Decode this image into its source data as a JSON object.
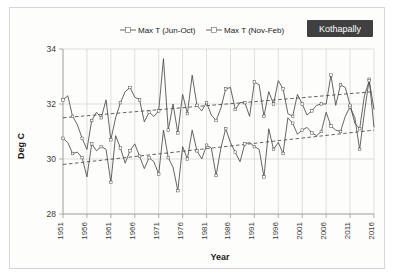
{
  "badge": {
    "label": "Kothapally",
    "bg": "#404040",
    "fg": "#ffffff"
  },
  "chart_data": {
    "type": "line",
    "title": "",
    "xlabel": "Year",
    "ylabel": "Deg C",
    "xlim": [
      1951,
      2016
    ],
    "ylim": [
      28,
      34
    ],
    "yticks": [
      28,
      30,
      32,
      34
    ],
    "xticks": [
      1951,
      1956,
      1961,
      1966,
      1971,
      1976,
      1981,
      1986,
      1991,
      1996,
      2001,
      2006,
      2011,
      2016
    ],
    "grid": true,
    "legend_position": "top-center",
    "line_color": "#4a4a4a",
    "trend_color": "#3a3a3a",
    "x": [
      1951,
      1952,
      1953,
      1954,
      1955,
      1956,
      1957,
      1958,
      1959,
      1960,
      1961,
      1962,
      1963,
      1964,
      1965,
      1966,
      1967,
      1968,
      1969,
      1970,
      1971,
      1972,
      1973,
      1974,
      1975,
      1976,
      1977,
      1978,
      1979,
      1980,
      1981,
      1982,
      1983,
      1984,
      1985,
      1986,
      1987,
      1988,
      1989,
      1990,
      1991,
      1992,
      1993,
      1994,
      1995,
      1996,
      1997,
      1998,
      1999,
      2000,
      2001,
      2002,
      2003,
      2004,
      2005,
      2006,
      2007,
      2008,
      2009,
      2010,
      2011,
      2012,
      2013,
      2014,
      2015,
      2016
    ],
    "series": [
      {
        "name": "Max T (Jun-Oct)",
        "marker": "open-square",
        "values": [
          30.75,
          30.6,
          30.2,
          30.25,
          30.05,
          29.35,
          30.55,
          30.3,
          30.45,
          30.35,
          29.15,
          30.85,
          30.4,
          29.85,
          30.3,
          30.55,
          30.1,
          29.65,
          30.05,
          29.9,
          29.45,
          31.05,
          30.05,
          29.7,
          28.85,
          30.45,
          30.0,
          31.05,
          30.3,
          30.0,
          30.5,
          30.4,
          29.4,
          30.4,
          31.1,
          30.6,
          30.25,
          29.9,
          30.55,
          30.6,
          30.45,
          30.35,
          29.35,
          31.1,
          30.35,
          30.6,
          30.2,
          31.5,
          31.3,
          30.9,
          31.05,
          31.15,
          30.95,
          30.85,
          31.0,
          31.7,
          31.2,
          31.05,
          31.0,
          31.55,
          31.9,
          31.5,
          30.35,
          31.7,
          32.9,
          31.15
        ]
      },
      {
        "name": "Max T (Nov-Feb)",
        "marker": "open-square",
        "values": [
          32.15,
          32.3,
          31.55,
          31.25,
          30.75,
          30.35,
          31.4,
          31.7,
          31.5,
          32.15,
          30.7,
          31.5,
          32.05,
          32.45,
          32.6,
          32.25,
          32.15,
          31.35,
          31.7,
          31.55,
          31.75,
          33.65,
          31.05,
          32.0,
          30.95,
          32.35,
          31.65,
          33.05,
          31.95,
          31.75,
          32.05,
          31.6,
          31.4,
          31.85,
          32.55,
          32.6,
          31.8,
          32.05,
          32.05,
          31.55,
          32.8,
          32.7,
          31.55,
          32.45,
          32.0,
          32.85,
          32.55,
          31.65,
          31.55,
          32.35,
          32.0,
          31.6,
          31.75,
          31.95,
          32.0,
          32.0,
          33.05,
          31.95,
          32.7,
          32.6,
          31.95,
          31.3,
          31.1,
          32.3,
          32.85,
          31.8
        ]
      }
    ],
    "trendlines": [
      {
        "name": "Max T (Jun-Oct) trend",
        "x": [
          1951,
          2016
        ],
        "y": [
          29.8,
          31.05
        ]
      },
      {
        "name": "Max T (Nov-Feb) trend",
        "x": [
          1951,
          2016
        ],
        "y": [
          31.5,
          32.45
        ]
      }
    ]
  }
}
